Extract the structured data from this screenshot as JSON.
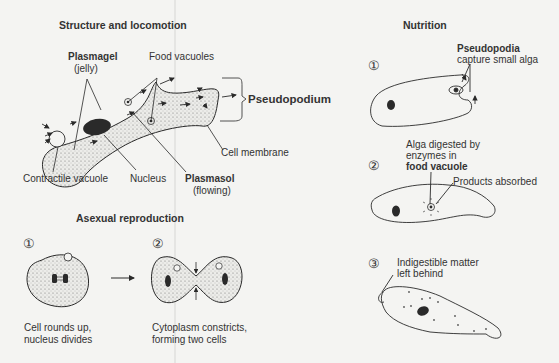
{
  "sections": {
    "structure": {
      "title": "Structure and locomotion",
      "labels": {
        "plasmagel": "Plasmagel",
        "plasmagel_sub": "(jelly)",
        "food_vacuoles": "Food vacuoles",
        "pseudopodium": "Pseudopodium",
        "cell_membrane": "Cell membrane",
        "contractile_vacuole": "Contractile vacuole",
        "nucleus": "Nucleus",
        "plasmasol": "Plasmasol",
        "plasmasol_sub": "(flowing)"
      }
    },
    "reproduction": {
      "title": "Asexual reproduction",
      "steps": [
        {
          "number": "①",
          "caption_1": "Cell rounds up,",
          "caption_2": "nucleus divides"
        },
        {
          "number": "②",
          "caption_1": "Cytoplasm constricts,",
          "caption_2": "forming two cells"
        }
      ]
    },
    "nutrition": {
      "title": "Nutrition",
      "steps": [
        {
          "number": "①",
          "label_bold": "Pseudopodia",
          "label": "capture small alga"
        },
        {
          "number": "②",
          "label_1": "Alga digested by",
          "label_2": "enzymes in",
          "label_bold": "food vacuole",
          "label_side": "Products absorbed"
        },
        {
          "number": "③",
          "label_1": "Indigestible matter",
          "label_2": "left behind"
        }
      ]
    }
  },
  "colors": {
    "ink": "#2a2a2a",
    "background": "#f4f4f2",
    "stipple": "#e2e2df"
  }
}
